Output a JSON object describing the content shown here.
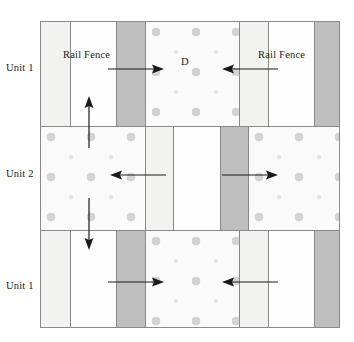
{
  "figure": {
    "type": "schematic-diagram",
    "title_visible": false,
    "background_color": "#ffffff",
    "frame": {
      "border_color": "#8a8a8a",
      "x": 40,
      "y": 21,
      "width": 300,
      "height": 307
    }
  },
  "colors": {
    "white_strip": "#fefefe",
    "light_strip": "#f2f2f0",
    "dark_strip": "#bebebe",
    "dotted_background": "#fafafa",
    "dot_large": "#d3d3d3",
    "dot_small": "#e2e2e2",
    "line": "#8a8a8a",
    "arrow": "#1a1a1a",
    "text": "#1a1a1a"
  },
  "row_labels": [
    {
      "id": "row-1",
      "text": "Unit 1"
    },
    {
      "id": "row-2",
      "text": "Unit 2"
    },
    {
      "id": "row-3",
      "text": "Unit 1"
    }
  ],
  "annotations": {
    "rail_fence_left": "Rail Fence",
    "rail_fence_right": "Rail Fence",
    "distance_label": "D"
  },
  "bands": [
    {
      "id": "band-top",
      "unit": "Unit 1",
      "strips": [
        {
          "fill": "light",
          "x_pct": 0,
          "w_pct": 9.5
        },
        {
          "fill": "white",
          "x_pct": 9.5,
          "w_pct": 15.5
        },
        {
          "fill": "dark",
          "x_pct": 25.0,
          "w_pct": 9.5
        },
        {
          "fill": "dots",
          "x_pct": 34.5,
          "w_pct": 31.5
        },
        {
          "fill": "light",
          "x_pct": 66.0,
          "w_pct": 9.5
        },
        {
          "fill": "white",
          "x_pct": 75.5,
          "w_pct": 15.5
        },
        {
          "fill": "dark",
          "x_pct": 91.0,
          "w_pct": 9.0
        }
      ]
    },
    {
      "id": "band-middle",
      "unit": "Unit 2",
      "strips": [
        {
          "fill": "dots",
          "x_pct": 0,
          "w_pct": 34.5
        },
        {
          "fill": "light",
          "x_pct": 34.5,
          "w_pct": 9.5
        },
        {
          "fill": "white",
          "x_pct": 44.0,
          "w_pct": 15.5
        },
        {
          "fill": "dark",
          "x_pct": 59.5,
          "w_pct": 9.5
        },
        {
          "fill": "dots",
          "x_pct": 69.0,
          "w_pct": 31.0
        }
      ]
    },
    {
      "id": "band-bottom",
      "unit": "Unit 1",
      "strips": [
        {
          "fill": "light",
          "x_pct": 0,
          "w_pct": 9.5
        },
        {
          "fill": "white",
          "x_pct": 9.5,
          "w_pct": 15.5
        },
        {
          "fill": "dark",
          "x_pct": 25.0,
          "w_pct": 9.5
        },
        {
          "fill": "dots",
          "x_pct": 34.5,
          "w_pct": 31.5
        },
        {
          "fill": "light",
          "x_pct": 66.0,
          "w_pct": 9.5
        },
        {
          "fill": "white",
          "x_pct": 75.5,
          "w_pct": 15.5
        },
        {
          "fill": "dark",
          "x_pct": 91.0,
          "w_pct": 9.0
        }
      ]
    }
  ],
  "arrows": [
    {
      "id": "arrow-top-right",
      "direction": "right",
      "band": "band-top"
    },
    {
      "id": "arrow-top-left",
      "direction": "left",
      "band": "band-top"
    },
    {
      "id": "arrow-mid-left",
      "direction": "left",
      "band": "band-middle"
    },
    {
      "id": "arrow-mid-right",
      "direction": "right",
      "band": "band-middle"
    },
    {
      "id": "arrow-bottom-right",
      "direction": "right",
      "band": "band-bottom"
    },
    {
      "id": "arrow-bottom-left",
      "direction": "left",
      "band": "band-bottom"
    },
    {
      "id": "arrow-up",
      "direction": "up",
      "band": "band-middle-to-top"
    },
    {
      "id": "arrow-down",
      "direction": "down",
      "band": "band-middle-to-bottom"
    }
  ]
}
